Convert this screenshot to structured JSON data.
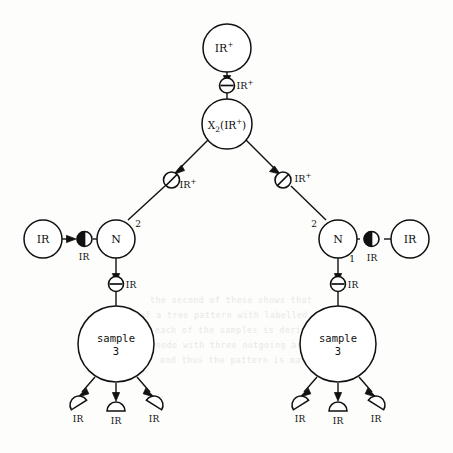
{
  "diagram": {
    "nodes": {
      "root_source": {
        "label": "IR",
        "sup": "+"
      },
      "center": {
        "prefix": "X",
        "sub": "2",
        "paren_open": "(",
        "inner": "IR",
        "inner_sup": "+",
        "paren_close": ")"
      },
      "left_n": {
        "label": "N"
      },
      "right_n": {
        "label": "N"
      },
      "left_operand": {
        "label": "IR"
      },
      "right_operand": {
        "label": "IR"
      },
      "left_sample": {
        "line1": "sample",
        "line2": "3"
      },
      "right_sample": {
        "line1": "sample",
        "line2": "3"
      }
    },
    "connectors": {
      "top_minus": {
        "label": "IR",
        "sup": "+",
        "glyph": "circle-horizontal-bar"
      },
      "left_slash": {
        "label": "IR",
        "sup": "+",
        "glyph": "circle-diagonal-slash"
      },
      "right_slash": {
        "label": "IR",
        "sup": "+",
        "glyph": "circle-diagonal-slash"
      },
      "left_split": {
        "label": "IR",
        "glyph": "circle-vertical-split"
      },
      "right_split": {
        "label": "IR",
        "glyph": "circle-vertical-split"
      },
      "left_minus": {
        "label": "IR",
        "glyph": "circle-horizontal-bar"
      },
      "right_minus": {
        "label": "IR",
        "glyph": "circle-horizontal-bar"
      }
    },
    "port_labels": {
      "left_n_port": "2",
      "right_n_port_upper": "2",
      "right_n_port_lower": "1"
    },
    "leaves": {
      "left": [
        {
          "label": "IR",
          "glyph": "half-disc"
        },
        {
          "label": "IR",
          "glyph": "half-disc"
        },
        {
          "label": "IR",
          "glyph": "half-disc"
        }
      ],
      "right": [
        {
          "label": "IR",
          "glyph": "half-disc"
        },
        {
          "label": "IR",
          "glyph": "half-disc"
        },
        {
          "label": "IR",
          "glyph": "half-disc"
        }
      ]
    },
    "colors": {
      "ink": "#111111",
      "paper": "#fdfdfc",
      "bleed": "#e9e7e4"
    },
    "background_bleed": [
      "the second of these shows that",
      "of a tree pattern with labelled nodes",
      "each of the samples is derived from",
      "a node with three outgoing arcs",
      "and thus the pattern is matched"
    ]
  }
}
